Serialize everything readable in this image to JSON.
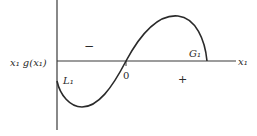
{
  "figure": {
    "y_axis_label": "x₁ g(x₁)",
    "x_axis_label": "x₁",
    "origin_label": "0",
    "negative_region_sign": "−",
    "positive_region_sign": "+",
    "left_bound_label": "L₁",
    "right_bound_label": "G₁",
    "colors": {
      "stroke": "#2a2a2a",
      "axis": "#3a3a3a",
      "background": "#ffffff"
    }
  }
}
